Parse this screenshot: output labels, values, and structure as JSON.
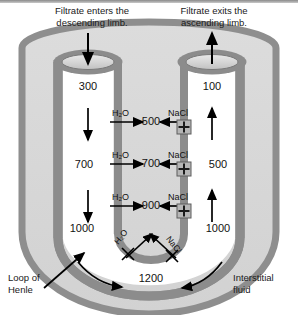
{
  "figure": {
    "captions": {
      "left": "Filtrate enters the\ndescending limb.",
      "left_line1": "Filtrate enters the",
      "left_line2": "descending limb.",
      "right_line1": "Filtrate exits the",
      "right_line2": "ascending limb."
    },
    "labels": {
      "loop_line1": "Loop of",
      "loop_line2": "Henle",
      "interstitial_line1": "Interstitial",
      "interstitial_line2": "fluid"
    },
    "colors": {
      "tube_wall": "#8c8c8c",
      "tube_lumen": "#ffffff",
      "interstitium": "#d8d8d8",
      "outer_wall": "#9a9a9a",
      "text": "#111111",
      "arrow": "#000000"
    }
  },
  "descending_limb": {
    "name": "descending limb",
    "values": [
      "300",
      "700",
      "1000"
    ],
    "flow_direction": "down"
  },
  "ascending_limb": {
    "name": "ascending limb",
    "values": [
      "100",
      "500",
      "1000"
    ],
    "flow_direction": "up"
  },
  "interstitial_values": [
    "500",
    "700",
    "900",
    "1200"
  ],
  "transport_rows": [
    {
      "water_label": "H₂O",
      "water_dir": "right",
      "interstitial": "500",
      "solute_label": "NaCl",
      "solute_dir": "left",
      "pump": "+"
    },
    {
      "water_label": "H₂O",
      "water_dir": "right",
      "interstitial": "700",
      "solute_label": "NaCl",
      "solute_dir": "left",
      "pump": "+"
    },
    {
      "water_label": "H₂O",
      "water_dir": "right",
      "interstitial": "900",
      "solute_label": "NaCl",
      "solute_dir": "left",
      "pump": "+"
    }
  ],
  "loop_bottom": {
    "interstitial_value": "1200",
    "blocked_water": "H₂O",
    "blocked_solute": "NaCl",
    "blocked_marker": "X"
  },
  "icons": {
    "pump": "+",
    "block": "X",
    "arrow_in": "↓",
    "arrow_out": "↑"
  }
}
